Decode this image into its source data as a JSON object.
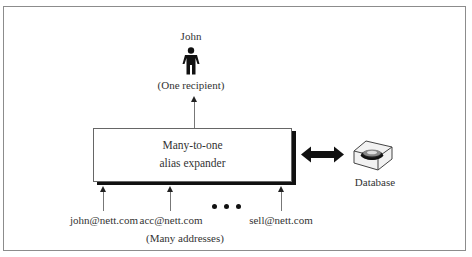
{
  "diagram": {
    "type": "many-to-one alias expansion",
    "recipient": {
      "name": "John",
      "icon": "person-icon",
      "caption": "(One recipient)"
    },
    "expander": {
      "line1": "Many-to-one",
      "line2": "alias expander",
      "shadow_color": "#111111"
    },
    "database": {
      "label": "Database",
      "icon": "database-icon",
      "connector": "bidirectional-arrow"
    },
    "addresses": {
      "items": [
        "john@nett.com",
        "acc@nett.com",
        "sell@nett.com"
      ],
      "ellipsis": "• • •",
      "caption": "(Many addresses)"
    },
    "colors": {
      "frame_border": "#8c8c8c",
      "text": "#333333",
      "arrow": "#111111"
    }
  }
}
